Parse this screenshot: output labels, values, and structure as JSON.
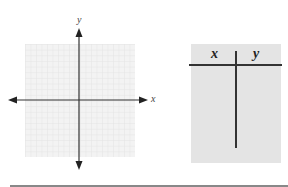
{
  "graph": {
    "x_axis_label": "x",
    "y_axis_label": "y",
    "grid": {
      "columns": 20,
      "rows": 20,
      "color": "#e6e6e6",
      "background": "#f3f3f3"
    },
    "axis_color": "#333333"
  },
  "table": {
    "columns": [
      "x",
      "y"
    ],
    "rows": [],
    "background": "#e4e4e4"
  }
}
